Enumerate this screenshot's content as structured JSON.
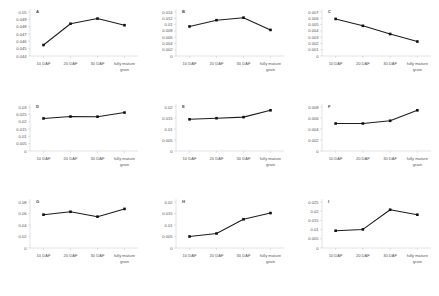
{
  "figure": {
    "panel_count": 9,
    "shared_categories": [
      "10 DAF",
      "20 DAF",
      "30 DAF",
      "fully mature grain"
    ]
  },
  "chart_data": [
    {
      "type": "line",
      "panel": "A",
      "title": "A",
      "xlabel": "",
      "ylabel": "",
      "categories": [
        "10 DAF",
        "20 DAF",
        "30 DAF",
        "fully mature grain"
      ],
      "values": [
        0.0455,
        0.0484,
        0.0491,
        0.0482
      ],
      "ylim": [
        0.044,
        0.05
      ],
      "yticks": [
        0.044,
        0.045,
        0.046,
        0.047,
        0.048,
        0.049,
        0.05
      ],
      "ytick_labels": [
        "0.044",
        "0.045",
        "0.046",
        "0.047",
        "0.048",
        "0.049",
        "0.05"
      ],
      "grid": false,
      "legend": "none"
    },
    {
      "type": "line",
      "panel": "B",
      "title": "B",
      "xlabel": "",
      "ylabel": "",
      "categories": [
        "10 DAF",
        "20 DAF",
        "30 DAF",
        "fully mature grain"
      ],
      "values": [
        0.0094,
        0.0114,
        0.0122,
        0.0083
      ],
      "ylim": [
        0,
        0.014
      ],
      "yticks": [
        0,
        0.002,
        0.004,
        0.006,
        0.008,
        0.01,
        0.012,
        0.014
      ],
      "ytick_labels": [
        "0",
        "0.002",
        "0.004",
        "0.006",
        "0.008",
        "0.01",
        "0.012",
        "0.014"
      ],
      "grid": false,
      "legend": "none"
    },
    {
      "type": "line",
      "panel": "C",
      "title": "C",
      "xlabel": "",
      "ylabel": "",
      "categories": [
        "10 DAF",
        "20 DAF",
        "30 DAF",
        "fully mature grain"
      ],
      "values": [
        0.0059,
        0.0048,
        0.0035,
        0.0023
      ],
      "ylim": [
        0,
        0.007
      ],
      "yticks": [
        0,
        0.001,
        0.002,
        0.003,
        0.004,
        0.005,
        0.006,
        0.007
      ],
      "ytick_labels": [
        "0",
        "0.001",
        "0.002",
        "0.003",
        "0.004",
        "0.005",
        "0.006",
        "0.007"
      ],
      "grid": false,
      "legend": "none"
    },
    {
      "type": "line",
      "panel": "D",
      "title": "D",
      "xlabel": "",
      "ylabel": "",
      "categories": [
        "10 DAF",
        "20 DAF",
        "30 DAF",
        "fully mature grain"
      ],
      "values": [
        0.0222,
        0.0235,
        0.0234,
        0.0262
      ],
      "ylim": [
        0,
        0.03
      ],
      "yticks": [
        0,
        0.005,
        0.01,
        0.015,
        0.02,
        0.025,
        0.03
      ],
      "ytick_labels": [
        "0",
        "0.005",
        "0.01",
        "0.015",
        "0.02",
        "0.025",
        "0.03"
      ],
      "grid": false,
      "legend": "none"
    },
    {
      "type": "line",
      "panel": "E",
      "title": "E",
      "xlabel": "",
      "ylabel": "",
      "categories": [
        "10 DAF",
        "20 DAF",
        "30 DAF",
        "fully mature grain"
      ],
      "values": [
        0.0144,
        0.0149,
        0.0154,
        0.0185
      ],
      "ylim": [
        0,
        0.02
      ],
      "yticks": [
        0,
        0.005,
        0.01,
        0.015,
        0.02
      ],
      "ytick_labels": [
        "0",
        "0.005",
        "0.01",
        "0.015",
        "0.02"
      ],
      "grid": false,
      "legend": "none"
    },
    {
      "type": "line",
      "panel": "F",
      "title": "F",
      "xlabel": "",
      "ylabel": "",
      "categories": [
        "10 DAF",
        "20 DAF",
        "30 DAF",
        "fully mature grain"
      ],
      "values": [
        0.005,
        0.005,
        0.0055,
        0.0074
      ],
      "ylim": [
        0,
        0.008
      ],
      "yticks": [
        0,
        0.002,
        0.004,
        0.006,
        0.008
      ],
      "ytick_labels": [
        "0",
        "0.002",
        "0.004",
        "0.006",
        "0.008"
      ],
      "grid": false,
      "legend": "none"
    },
    {
      "type": "line",
      "panel": "G",
      "title": "G",
      "xlabel": "",
      "ylabel": "",
      "categories": [
        "10 DAF",
        "20 DAF",
        "30 DAF",
        "fully mature grain"
      ],
      "values": [
        0.058,
        0.063,
        0.0545,
        0.068
      ],
      "ylim": [
        0,
        0.08
      ],
      "yticks": [
        0,
        0.02,
        0.04,
        0.06,
        0.08
      ],
      "ytick_labels": [
        "0",
        "0.02",
        "0.04",
        "0.06",
        "0.08"
      ],
      "grid": false,
      "legend": "none"
    },
    {
      "type": "line",
      "panel": "H",
      "title": "H",
      "xlabel": "",
      "ylabel": "",
      "categories": [
        "10 DAF",
        "20 DAF",
        "30 DAF",
        "fully mature grain"
      ],
      "values": [
        0.005,
        0.0063,
        0.0125,
        0.0152
      ],
      "ylim": [
        0,
        0.02
      ],
      "yticks": [
        0,
        0.005,
        0.01,
        0.015,
        0.02
      ],
      "ytick_labels": [
        "0",
        "0.005",
        "0.01",
        "0.015",
        "0.02"
      ],
      "grid": false,
      "legend": "none"
    },
    {
      "type": "line",
      "panel": "I",
      "title": "I",
      "xlabel": "",
      "ylabel": "",
      "categories": [
        "10 DAF",
        "20 DAF",
        "30 DAF",
        "fully mature grain"
      ],
      "values": [
        0.0094,
        0.0101,
        0.0208,
        0.0181
      ],
      "ylim": [
        0,
        0.025
      ],
      "yticks": [
        0,
        0.005,
        0.01,
        0.015,
        0.02,
        0.025
      ],
      "ytick_labels": [
        "0",
        "0.005",
        "0.01",
        "0.015",
        "0.02",
        "0.025"
      ],
      "grid": false,
      "legend": "none"
    }
  ]
}
